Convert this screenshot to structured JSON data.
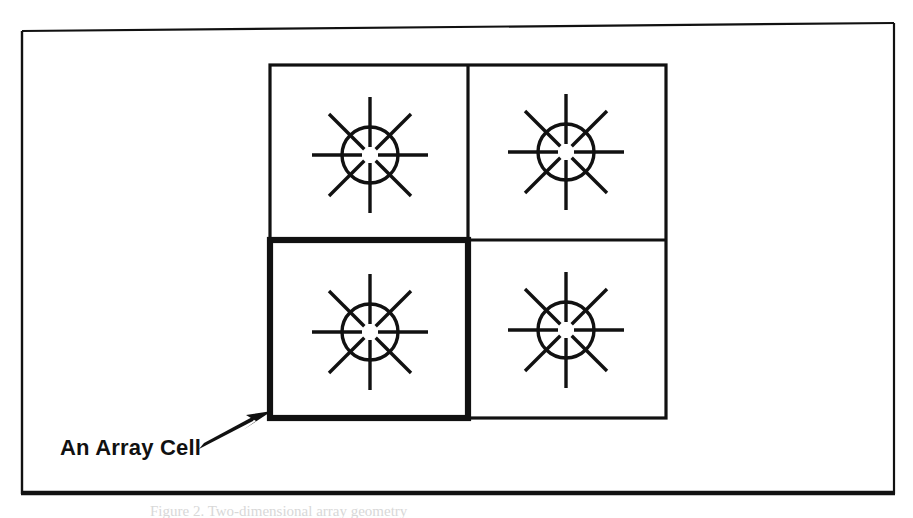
{
  "figure": {
    "kind": "line-drawing-diagram",
    "background_color": "#ffffff",
    "ink_color": "#111111",
    "outer_frame": {
      "name": "outer-frame",
      "x": 21,
      "y": 30,
      "width": 874,
      "height": 465,
      "stroke_width": 2,
      "bottom_stroke_width": 4
    },
    "grid": {
      "name": "antenna-array-grid",
      "rows": 2,
      "cols": 2,
      "x": 270,
      "y": 65,
      "width": 396,
      "height": 353,
      "divider_x": 468,
      "divider_y": 240,
      "normal_stroke_width": 3,
      "highlight_stroke_width": 6,
      "highlighted_cell": "row2-col1"
    },
    "cells": [
      {
        "id": "row1-col1",
        "name": "array-cell-top-left",
        "highlighted": false,
        "element_center_x": 370,
        "element_center_y": 155
      },
      {
        "id": "row1-col2",
        "name": "array-cell-top-right",
        "highlighted": false,
        "element_center_x": 566,
        "element_center_y": 152
      },
      {
        "id": "row2-col1",
        "name": "array-cell-bottom-left",
        "highlighted": true,
        "element_center_x": 370,
        "element_center_y": 332
      },
      {
        "id": "row2-col2",
        "name": "array-cell-bottom-right",
        "highlighted": false,
        "element_center_x": 566,
        "element_center_y": 330
      }
    ],
    "radiator": {
      "name": "radiating-element-symbol",
      "circle_radius": 28,
      "circle_stroke_width": 3.2,
      "spoke_count": 8,
      "spoke_inner_radius": 8,
      "spoke_outer_radius": 58,
      "spoke_stroke_width": 3.2,
      "spoke_angles_deg": [
        0,
        45,
        90,
        135,
        180,
        225,
        270,
        315
      ]
    },
    "annotation": {
      "name": "array-cell-callout",
      "label": "An Array Cell",
      "label_x": 60,
      "label_y": 455,
      "arrow": {
        "name": "callout-arrow",
        "tail_x": 200,
        "tail_y": 447,
        "tip_x": 272,
        "tip_y": 412,
        "stroke_width": 4,
        "head_length": 24,
        "head_width": 15
      }
    },
    "clipped_caption": {
      "name": "clipped-figure-caption",
      "text": "Figure 2. Two-dimensional array geometry",
      "visible": false
    }
  }
}
